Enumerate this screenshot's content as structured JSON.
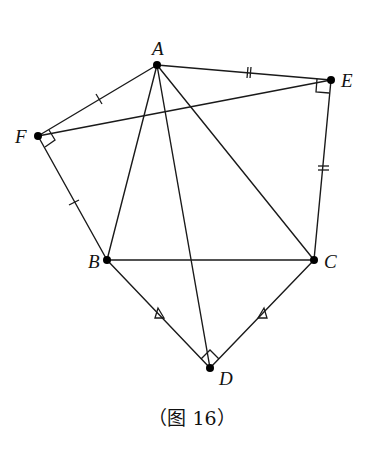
{
  "figure": {
    "caption": "（图 16）",
    "points": {
      "A": {
        "label": "A",
        "x": 157,
        "y": 65
      },
      "B": {
        "label": "B",
        "x": 107,
        "y": 260
      },
      "C": {
        "label": "C",
        "x": 314,
        "y": 260
      },
      "D": {
        "label": "D",
        "x": 210,
        "y": 368
      },
      "E": {
        "label": "E",
        "x": 331,
        "y": 80
      },
      "F": {
        "label": "F",
        "x": 38,
        "y": 136
      }
    },
    "segments": [
      "AB",
      "AC",
      "AD",
      "AE",
      "AF",
      "BC",
      "BD",
      "CD",
      "CE",
      "EF",
      "FB"
    ],
    "right_angles": [
      "E (∠AEC)",
      "F (∠AFB)",
      "D (∠BDC)"
    ],
    "equal_marks": {
      "single_tick": [
        "AF",
        "FB"
      ],
      "double_tick": [
        "AE",
        "EC"
      ],
      "triangle": [
        "BD",
        "DC"
      ]
    }
  }
}
